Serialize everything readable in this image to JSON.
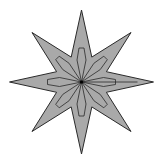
{
  "figure": {
    "type": "eight-pointed-star",
    "center": [
      81.5,
      82
    ],
    "outer_radius_cardinal": 72,
    "outer_radius_diagonal": 70,
    "inner_radius": 27,
    "points": 8,
    "colors": {
      "fill": "#a9a9a9",
      "stroke": "#2a2a2a",
      "background": "#ffffff"
    }
  }
}
